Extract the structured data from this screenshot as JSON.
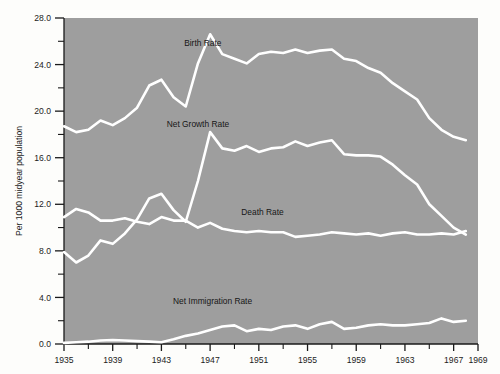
{
  "chart_data": {
    "type": "line",
    "title": "",
    "xlabel": "",
    "ylabel": "Per 1000 midyear population",
    "xlim": [
      1935,
      1969
    ],
    "ylim": [
      0.0,
      28.0
    ],
    "grid": false,
    "legend": "inline-labels",
    "background_color": "#9e9e9e",
    "line_color": "#ffffff",
    "y_ticks_major": [
      "0.0",
      "4.0",
      "8.0",
      "12.0",
      "16.0",
      "20.0",
      "24.0",
      "28.0"
    ],
    "y_tick_values": [
      0.0,
      4.0,
      8.0,
      12.0,
      16.0,
      20.0,
      24.0,
      28.0
    ],
    "y_ticks_minor": [
      2.0,
      6.0,
      10.0,
      14.0,
      18.0,
      22.0,
      26.0
    ],
    "x_ticks_major": [
      "1935",
      "1939",
      "1943",
      "1947",
      "1951",
      "1955",
      "1959",
      "1963",
      "1967",
      "1969"
    ],
    "x_tick_values": [
      1935,
      1939,
      1943,
      1947,
      1951,
      1955,
      1959,
      1963,
      1967,
      1969
    ],
    "x_ticks_minor": [
      1937,
      1941,
      1945,
      1949,
      1953,
      1957,
      1961,
      1965
    ],
    "x": [
      1935,
      1936,
      1937,
      1938,
      1939,
      1940,
      1941,
      1942,
      1943,
      1944,
      1945,
      1946,
      1947,
      1948,
      1949,
      1950,
      1951,
      1952,
      1953,
      1954,
      1955,
      1956,
      1957,
      1958,
      1959,
      1960,
      1961,
      1962,
      1963,
      1964,
      1965,
      1966,
      1967,
      1968
    ],
    "series": [
      {
        "name": "Birth Rate",
        "label": "Birth Rate",
        "label_x": 1946.4,
        "label_y": 25.6,
        "values": [
          18.7,
          18.2,
          18.4,
          19.2,
          18.8,
          19.4,
          20.3,
          22.2,
          22.7,
          21.2,
          20.4,
          24.1,
          26.6,
          24.9,
          24.5,
          24.1,
          24.9,
          25.1,
          25.0,
          25.3,
          25.0,
          25.2,
          25.3,
          24.5,
          24.3,
          23.7,
          23.3,
          22.4,
          21.7,
          21.0,
          19.4,
          18.4,
          17.8,
          17.5
        ],
        "units": "per 1000 midyear population"
      },
      {
        "name": "Net Growth Rate",
        "label": "Net Growth Rate",
        "label_x": 1946.0,
        "label_y": 18.6,
        "values": [
          7.9,
          7.0,
          7.6,
          8.9,
          8.6,
          9.5,
          10.7,
          12.5,
          12.9,
          11.5,
          10.5,
          14.0,
          18.2,
          16.8,
          16.6,
          17.0,
          16.5,
          16.8,
          16.9,
          17.4,
          17.0,
          17.3,
          17.5,
          16.3,
          16.2,
          16.2,
          16.1,
          15.4,
          14.5,
          13.7,
          12.0,
          11.0,
          10.0,
          9.4
        ],
        "units": "per 1000 midyear population"
      },
      {
        "name": "Death Rate",
        "label": "Death Rate",
        "label_x": 1951.3,
        "label_y": 11.1,
        "values": [
          10.9,
          11.6,
          11.3,
          10.6,
          10.6,
          10.8,
          10.5,
          10.3,
          10.9,
          10.6,
          10.6,
          10.0,
          10.4,
          9.9,
          9.7,
          9.6,
          9.7,
          9.6,
          9.6,
          9.2,
          9.3,
          9.4,
          9.6,
          9.5,
          9.4,
          9.5,
          9.3,
          9.5,
          9.6,
          9.4,
          9.4,
          9.5,
          9.4,
          9.7
        ],
        "units": "per 1000 midyear population"
      },
      {
        "name": "Net Immigration Rate",
        "label": "Net Immigration Rate",
        "label_x": 1947.2,
        "label_y": 3.4,
        "values": [
          0.1,
          0.15,
          0.2,
          0.3,
          0.35,
          0.3,
          0.25,
          0.2,
          0.15,
          0.4,
          0.7,
          0.9,
          1.2,
          1.5,
          1.6,
          1.1,
          1.3,
          1.2,
          1.5,
          1.6,
          1.3,
          1.7,
          1.9,
          1.3,
          1.4,
          1.6,
          1.7,
          1.6,
          1.6,
          1.7,
          1.8,
          2.2,
          1.9,
          2.0
        ],
        "units": "per 1000 midyear population"
      }
    ]
  },
  "axes": {
    "y_axis_title": "Per 1000 midyear population"
  }
}
